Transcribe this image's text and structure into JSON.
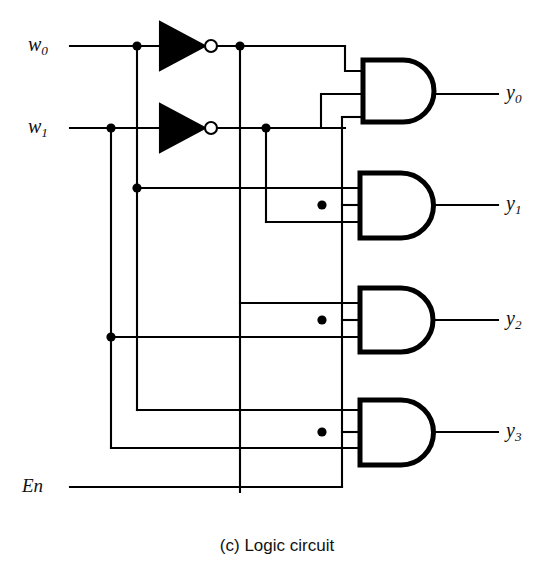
{
  "figure": {
    "caption": "(c) Logic circuit",
    "kind": "logic-circuit-diagram",
    "stroke_color": "#000000",
    "background_color": "#ffffff"
  },
  "inputs": [
    {
      "id": "w0",
      "base": "w",
      "sub": "0",
      "label": "w0",
      "y": 46
    },
    {
      "id": "w1",
      "base": "w",
      "sub": "1",
      "label": "w1",
      "y": 128
    },
    {
      "id": "En",
      "base": "En",
      "sub": "",
      "label": "En",
      "y": 487
    }
  ],
  "outputs": [
    {
      "id": "y0",
      "base": "y",
      "sub": "0",
      "label": "y0",
      "y": 94
    },
    {
      "id": "y1",
      "base": "y",
      "sub": "1",
      "label": "y1",
      "y": 205
    },
    {
      "id": "y2",
      "base": "y",
      "sub": "2",
      "label": "y2",
      "y": 320
    },
    {
      "id": "y3",
      "base": "y",
      "sub": "3",
      "label": "y3",
      "y": 432
    }
  ],
  "gates": [
    {
      "id": "not-w0",
      "type": "NOT",
      "inputs": [
        "w0"
      ],
      "output": "w0_bar"
    },
    {
      "id": "not-w1",
      "type": "NOT",
      "inputs": [
        "w1"
      ],
      "output": "w1_bar"
    },
    {
      "id": "and-y0",
      "type": "AND",
      "num_inputs": 3,
      "inputs": [
        "w0_bar",
        "w1_bar",
        "En"
      ],
      "output": "y0"
    },
    {
      "id": "and-y1",
      "type": "AND",
      "num_inputs": 3,
      "inputs": [
        "w0",
        "w1_bar",
        "En"
      ],
      "output": "y1"
    },
    {
      "id": "and-y2",
      "type": "AND",
      "num_inputs": 3,
      "inputs": [
        "w0_bar",
        "w1",
        "En"
      ],
      "output": "y2"
    },
    {
      "id": "and-y3",
      "type": "AND",
      "num_inputs": 3,
      "inputs": [
        "w0",
        "w1",
        "En"
      ],
      "output": "y3"
    }
  ],
  "junction_dots": [
    {
      "x": 137,
      "y": 46
    },
    {
      "x": 240,
      "y": 46
    },
    {
      "x": 111,
      "y": 128
    },
    {
      "x": 266,
      "y": 128
    },
    {
      "x": 137,
      "y": 188
    },
    {
      "x": 322,
      "y": 205
    },
    {
      "x": 111,
      "y": 337
    },
    {
      "x": 322,
      "y": 320
    },
    {
      "x": 322,
      "y": 432
    }
  ]
}
